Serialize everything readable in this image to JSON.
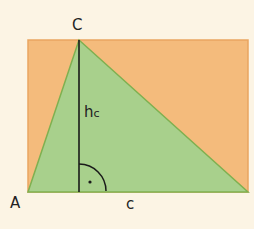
{
  "labels": {
    "vertex_a": "A",
    "vertex_c": "C",
    "side_c": "c",
    "height": "h",
    "height_sub": "c"
  },
  "colors": {
    "background": "#fcf4e4",
    "rectangle_fill": "#f4bb7c",
    "rectangle_stroke": "#e9a560",
    "triangle_fill": "#a8d08c",
    "triangle_stroke": "#7fb050",
    "line": "#1a1a1a"
  },
  "geometry": {
    "rect": {
      "x": 28,
      "y": 40,
      "w": 220,
      "h": 152
    },
    "triangle": {
      "A": [
        28,
        192
      ],
      "B": [
        248,
        192
      ],
      "C": [
        79,
        40
      ]
    },
    "foot": [
      79,
      192
    ]
  }
}
